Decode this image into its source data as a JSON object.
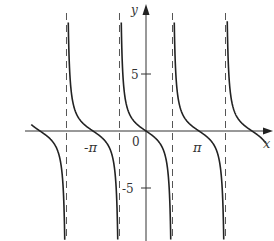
{
  "chart_data": {
    "type": "line",
    "function": "y = -tan(x)",
    "title": "",
    "xlabel": "x",
    "ylabel": "y",
    "origin_label": "0",
    "x_ticks": [
      {
        "value": -3.14159,
        "label": "-π"
      },
      {
        "value": 3.14159,
        "label": "π"
      }
    ],
    "y_ticks": [
      {
        "value": 5,
        "label": "5"
      },
      {
        "value": -5,
        "label": "-5"
      }
    ],
    "asymptotes": [
      -4.71239,
      -1.5708,
      1.5708,
      4.71239
    ],
    "asymptote_labels": [
      "x=-3π/2",
      "x=-π/2",
      "x=π/2",
      "x=3π/2"
    ],
    "zeros": [
      -6.28318,
      -3.14159,
      0,
      3.14159,
      6.28318
    ],
    "xlim": [
      -6.8,
      7.1
    ],
    "ylim": [
      -9.5,
      11
    ],
    "grid": false,
    "legend": null,
    "colors": {
      "curve": "#222222",
      "axis": "#333333",
      "asymptote": "#555555"
    }
  }
}
